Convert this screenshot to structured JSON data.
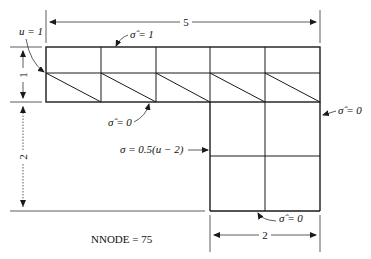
{
  "diagram": {
    "dimensions": {
      "top_width": "5",
      "upper_height": "1",
      "lower_height": "2",
      "bottom_width": "2"
    },
    "boundary_conditions": {
      "left_essential": "u = 1",
      "top_natural": "σ̂ = 1",
      "upper_bottom_natural": "σ̂ = 0",
      "right_natural": "σ̂ = 0",
      "inner_left_mixed": "σ = 0.5(u − 2)",
      "bottom_natural": "σ̂ = 0"
    },
    "mesh": {
      "upper_columns": 5,
      "upper_rows": 2,
      "lower_columns": 2,
      "lower_rows": 2
    },
    "annotation": "NNODE = 75"
  }
}
